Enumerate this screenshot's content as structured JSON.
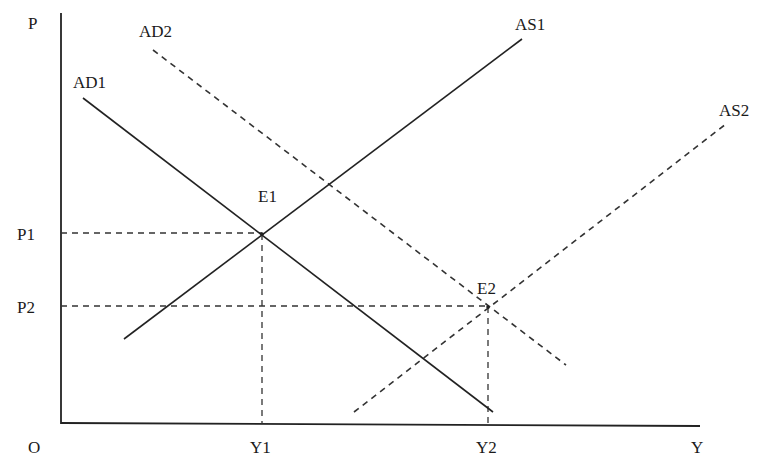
{
  "diagram": {
    "colors": {
      "line": "#222222",
      "dash": "#333333",
      "text": "#1a1a1a",
      "background": "#ffffff"
    },
    "axes": {
      "origin_label": "O",
      "y_label": "P",
      "x_label": "Y",
      "y_axis": {
        "x1": 61,
        "y1": 13,
        "x2": 61,
        "y2": 424
      },
      "x_axis": {
        "x1": 61,
        "y1": 423,
        "x2": 700,
        "y2": 426
      }
    },
    "curves": [
      {
        "id": "AD1",
        "label": "AD1",
        "style": "solid",
        "x1": 83,
        "y1": 98,
        "x2": 493,
        "y2": 412,
        "label_x": 73,
        "label_y": 88
      },
      {
        "id": "AD2",
        "label": "AD2",
        "style": "dashed",
        "x1": 153,
        "y1": 50,
        "x2": 566,
        "y2": 365,
        "label_x": 139,
        "label_y": 37
      },
      {
        "id": "AS1",
        "label": "AS1",
        "style": "solid",
        "x1": 124,
        "y1": 339,
        "x2": 522,
        "y2": 39,
        "label_x": 515,
        "label_y": 30
      },
      {
        "id": "AS2",
        "label": "AS2",
        "style": "dashed",
        "x1": 354,
        "y1": 412,
        "x2": 726,
        "y2": 124,
        "label_x": 719,
        "label_y": 116
      }
    ],
    "equilibria": [
      {
        "id": "E1",
        "label": "E1",
        "x": 262,
        "y": 234,
        "label_x": 258,
        "label_y": 202,
        "price_label": "P1",
        "output_label": "Y1"
      },
      {
        "id": "E2",
        "label": "E2",
        "x": 488,
        "y": 307,
        "label_x": 477,
        "label_y": 294,
        "price_label": "P2",
        "output_label": "Y2"
      }
    ],
    "guides": {
      "P1": {
        "label": "P1",
        "y": 233,
        "label_x": 17,
        "label_y": 240
      },
      "P2": {
        "label": "P2",
        "y": 306,
        "label_x": 17,
        "label_y": 313
      },
      "Y1": {
        "label": "Y1",
        "x": 262,
        "label_x": 250,
        "label_y": 453
      },
      "Y2": {
        "label": "Y2",
        "x": 488,
        "label_x": 476,
        "label_y": 453
      }
    },
    "label_positions": {
      "origin": {
        "x": 28,
        "y": 453
      },
      "y_label": {
        "x": 28,
        "y": 29
      },
      "x_label": {
        "x": 691,
        "y": 453
      }
    }
  }
}
